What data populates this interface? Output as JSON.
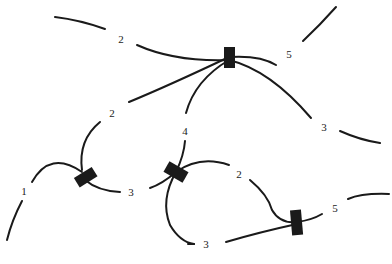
{
  "diagram": {
    "type": "network-junctions",
    "colors": {
      "stroke": "#1a1a1a",
      "background": "#ffffff"
    },
    "junctions": [
      {
        "id": "junction-top",
        "x": 229,
        "y": 57,
        "w": 10,
        "h": 20,
        "rotate": 0
      },
      {
        "id": "junction-left",
        "x": 85,
        "y": 177,
        "w": 20,
        "h": 10,
        "rotate": -30
      },
      {
        "id": "junction-center",
        "x": 176,
        "y": 172,
        "w": 22,
        "h": 11,
        "rotate": 30
      },
      {
        "id": "junction-right",
        "x": 297,
        "y": 222,
        "w": 10,
        "h": 24,
        "rotate": -5
      }
    ],
    "labels": [
      {
        "id": "label-top-2",
        "text": "2",
        "x": 121,
        "y": 39
      },
      {
        "id": "label-top-5",
        "text": "5",
        "x": 289,
        "y": 54
      },
      {
        "id": "label-top-3",
        "text": "3",
        "x": 324,
        "y": 127
      },
      {
        "id": "label-mid-2",
        "text": "2",
        "x": 112,
        "y": 113
      },
      {
        "id": "label-mid-4",
        "text": "4",
        "x": 185,
        "y": 131
      },
      {
        "id": "label-left-1",
        "text": "1",
        "x": 24,
        "y": 191
      },
      {
        "id": "label-left-3",
        "text": "3",
        "x": 131,
        "y": 192
      },
      {
        "id": "label-center-2",
        "text": "2",
        "x": 239,
        "y": 174
      },
      {
        "id": "label-right-5",
        "text": "5",
        "x": 335,
        "y": 208
      },
      {
        "id": "label-bottom-3",
        "text": "3",
        "x": 206,
        "y": 244
      }
    ]
  }
}
